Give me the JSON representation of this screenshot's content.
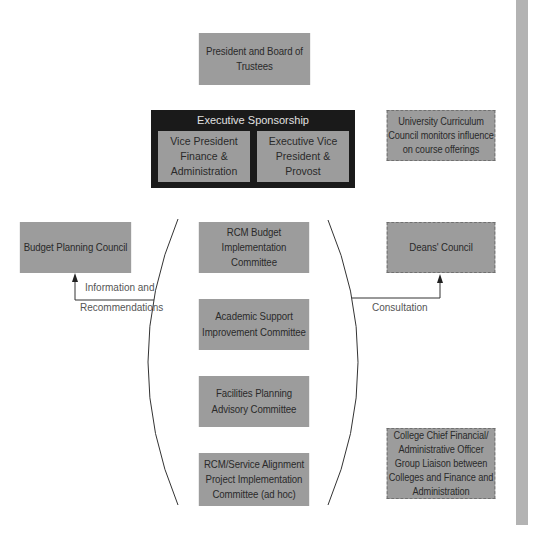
{
  "top": {
    "president_board": "President and Board of Trustees"
  },
  "executive_sponsorship": {
    "title": "Executive Sponsorship",
    "vp_finance": "Vice President Finance & Administration",
    "evp_provost": "Executive Vice President & Provost"
  },
  "left": {
    "budget_planning_council": "Budget Planning Council",
    "arrow_label_line1": "Information and",
    "arrow_label_line2": "Recommendations"
  },
  "center_committees": [
    {
      "label": "RCM Budget Implementation Committee"
    },
    {
      "label": "Academic Support Improvement Committee"
    },
    {
      "label": "Facilities Planning Advisory Committee"
    },
    {
      "label": "RCM/Service Alignment Project Implementation Committee (ad hoc)"
    }
  ],
  "right": {
    "university_curriculum_council": "University Curriculum Council monitors influence on course offerings",
    "deans_council": "Deans' Council",
    "consultation_label": "Consultation",
    "college_cfo_group": "College Chief Financial/ Administrative Officer Group Liaison between Colleges and Finance and Administration"
  },
  "colors": {
    "box_fill": "#9c9c9c",
    "exec_fill": "#1a1a1a",
    "line": "#333333",
    "side_bar": "#b3b3b3"
  }
}
